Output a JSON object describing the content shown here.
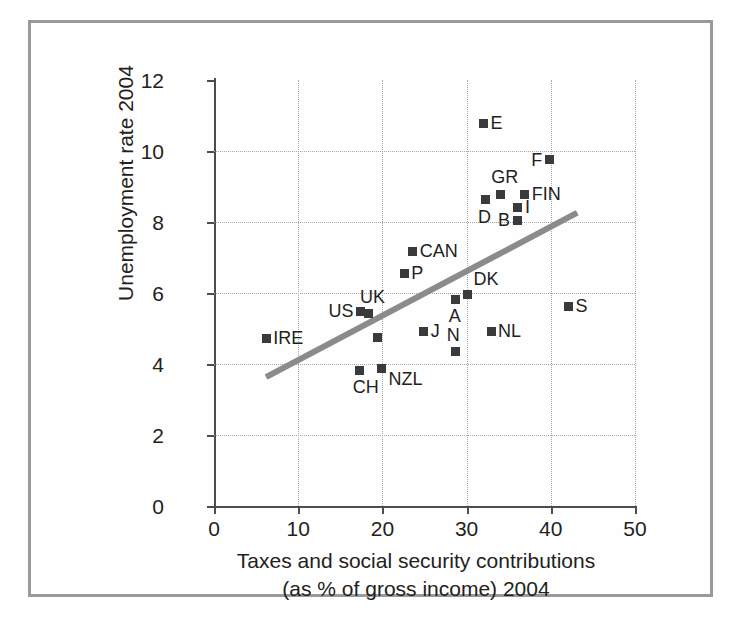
{
  "chart_data": {
    "type": "scatter",
    "title": "",
    "xlabel_line1": "Taxes and social security contributions",
    "xlabel_line2": "(as % of gross income) 2004",
    "ylabel": "Unemployment rate 2004",
    "xlim": [
      0,
      50
    ],
    "ylim": [
      0,
      12
    ],
    "xticks": [
      "0",
      "10",
      "20",
      "30",
      "40",
      "50"
    ],
    "yticks": [
      "0",
      "2",
      "4",
      "6",
      "8",
      "10",
      "12"
    ],
    "grid": true,
    "legend": "none",
    "marker_color": "#3a3a3c",
    "trendline_color": "#8b8b8d",
    "axis_color": "#4d4d4f",
    "grid_color": "#a7a7a9",
    "frame_color": "#9a9a9c",
    "points": [
      {
        "label": "IRE",
        "x": 6.2,
        "y": 4.72,
        "label_pos": "right"
      },
      {
        "label": "CH",
        "x": 17.3,
        "y": 3.82,
        "label_pos": "below"
      },
      {
        "label": "US",
        "x": 17.4,
        "y": 5.48,
        "label_pos": "left"
      },
      {
        "label": "UK",
        "x": 18.4,
        "y": 5.42,
        "label_pos": "above"
      },
      {
        "label": "NZL",
        "x": 19.9,
        "y": 3.88,
        "label_pos": "right-below"
      },
      {
        "label": "",
        "x": 19.4,
        "y": 4.75,
        "label_pos": "none"
      },
      {
        "label": "P",
        "x": 22.6,
        "y": 6.55,
        "label_pos": "right"
      },
      {
        "label": "CAN",
        "x": 23.6,
        "y": 7.18,
        "label_pos": "right"
      },
      {
        "label": "J",
        "x": 24.9,
        "y": 4.92,
        "label_pos": "right"
      },
      {
        "label": "A",
        "x": 28.7,
        "y": 5.82,
        "label_pos": "below"
      },
      {
        "label": "N",
        "x": 28.7,
        "y": 4.35,
        "label_pos": "above"
      },
      {
        "label": "DK",
        "x": 30.1,
        "y": 5.95,
        "label_pos": "right-above"
      },
      {
        "label": "NL",
        "x": 32.9,
        "y": 4.92,
        "label_pos": "right"
      },
      {
        "label": "E",
        "x": 32.0,
        "y": 10.78,
        "label_pos": "right"
      },
      {
        "label": "D",
        "x": 32.2,
        "y": 8.62,
        "label_pos": "below"
      },
      {
        "label": "GR",
        "x": 34.0,
        "y": 8.78,
        "label_pos": "above"
      },
      {
        "label": "B",
        "x": 36.0,
        "y": 8.05,
        "label_pos": "left"
      },
      {
        "label": "I",
        "x": 36.1,
        "y": 8.42,
        "label_pos": "right"
      },
      {
        "label": "FIN",
        "x": 36.9,
        "y": 8.78,
        "label_pos": "right"
      },
      {
        "label": "F",
        "x": 39.8,
        "y": 9.75,
        "label_pos": "left"
      },
      {
        "label": "S",
        "x": 42.1,
        "y": 5.62,
        "label_pos": "right"
      }
    ],
    "trendline": {
      "x1": 6.2,
      "y1": 3.62,
      "x2": 43.2,
      "y2": 8.25
    }
  }
}
